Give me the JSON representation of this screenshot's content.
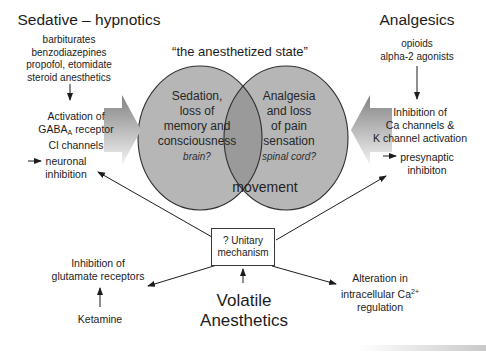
{
  "figure": {
    "description_title": "anesthetic mechanisms venn diagram",
    "colors": {
      "background": "#ffffff",
      "circle_fill": "#b6b6b6",
      "overlap_fill": "#9a9a9a",
      "circle_stroke": "#2f2f2f",
      "text": "#1c1c1c",
      "block_arrow_dark": "#828282",
      "block_arrow_light": "#f3f3f3"
    }
  },
  "left_section": {
    "title": "Sedative – hypnotics",
    "drugs": [
      "barbiturates",
      "benzodiazepines",
      "propofol, etomidate",
      "steroid anesthetics"
    ],
    "mechanism": {
      "line1": "Activation of",
      "line2_pre": "GABA",
      "line2_sub": "A",
      "line2_post": " receptor",
      "line3": "Cl channels"
    },
    "effect_line1": "neuronal",
    "effect_line2": "inhibition"
  },
  "right_section": {
    "title": "Analgesics",
    "drugs": [
      "opioids",
      "alpha-2 agonists"
    ],
    "mechanism": {
      "line1": "Inhibition of",
      "line2": "Ca channels &",
      "line3": "K channel activation"
    },
    "effect_line1": "presynaptic",
    "effect_line2": "inhibiton"
  },
  "venn": {
    "title": "“the anesthetized state”",
    "left_circle": {
      "line1": "Sedation,",
      "line2": "loss of",
      "line3": "memory and",
      "line4": "consciousness",
      "note": "brain?"
    },
    "right_circle": {
      "line1": "Analgesia",
      "line2": "and loss",
      "line3": "of pain",
      "line4": "sensation",
      "note": "spinal cord?"
    },
    "overlap_label": "movement"
  },
  "unitary_box": {
    "line1": "? Unitary",
    "line2": "mechanism"
  },
  "bottom_section": {
    "volatile_line1": "Volatile",
    "volatile_line2": "Anesthetics",
    "glutamate_line1": "Inhibition of",
    "glutamate_line2": "glutamate receptors",
    "ketamine": "Ketamine",
    "calcium": {
      "line1": "Alteration in",
      "line2_pre": "intracellular Ca",
      "line2_sup": "2+",
      "line3": "regulation"
    }
  }
}
